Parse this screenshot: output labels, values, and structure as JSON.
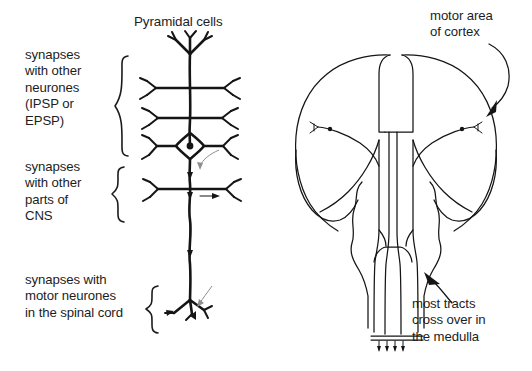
{
  "figure": {
    "kind": "biology-diagram",
    "background_color": "#ffffff",
    "ink_color": "#151515",
    "faint_ink_color": "#8e8e8e"
  },
  "left_panel": {
    "title": "Pyramidal cells",
    "labels": {
      "synapses_other_neurones": "synapses\nwith other\nneurones\n(IPSP or\nEPSP)",
      "synapses_other_cns": "synapses\nwith other\nparts of\nCNS",
      "synapses_motor_neurones": "synapses with\nmotor neurones\nin the spinal cord"
    },
    "braces": [
      {
        "name": "brace-neurones",
        "x": 118,
        "y_top": 55,
        "y_bottom": 157
      },
      {
        "name": "brace-cns",
        "x": 114,
        "y_top": 167,
        "y_bottom": 222
      },
      {
        "name": "brace-motor",
        "x": 148,
        "y_top": 285,
        "y_bottom": 333
      }
    ],
    "neuron": {
      "soma_x": 190,
      "soma_y": 146,
      "apical_dendrite_top_y": 52,
      "axon_bottom_y": 320,
      "dendrite_rows_y": [
        88,
        118,
        146,
        189
      ],
      "arrow_count": 4
    }
  },
  "right_panel": {
    "labels": {
      "motor_area_of_cortex": "motor area\nof cortex",
      "most_tracts_cross": "most tracts\ncross over in\nthe medulla"
    },
    "annotations": [
      {
        "name": "arrow-to-cortex",
        "target": "right cortex surface"
      },
      {
        "name": "arrow-to-medulla",
        "target": "medulla decussation"
      }
    ],
    "structures": [
      "left cerebral hemisphere",
      "right cerebral hemisphere",
      "longitudinal fissure",
      "internal capsule tracts",
      "brainstem",
      "medulla",
      "spinal cord"
    ],
    "cortical_neurons": 2
  }
}
